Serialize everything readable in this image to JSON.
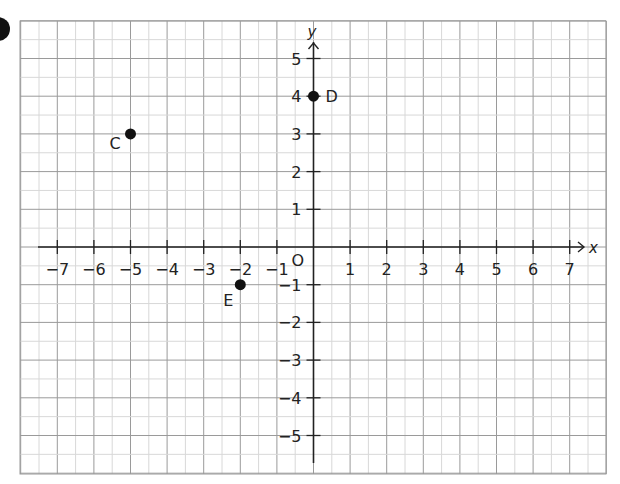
{
  "chart_data": {
    "type": "scatter",
    "title": "",
    "xlabel": "x",
    "ylabel": "y",
    "origin_label": "O",
    "xlim": [
      -7,
      7
    ],
    "ylim": [
      -5,
      5
    ],
    "x_ticks": [
      -7,
      -6,
      -5,
      -4,
      -3,
      -2,
      -1,
      1,
      2,
      3,
      4,
      5,
      6,
      7
    ],
    "y_ticks": [
      5,
      4,
      3,
      2,
      1,
      -1,
      -2,
      -3,
      -4,
      -5
    ],
    "x_tick_labels": [
      "−7",
      "−6",
      "−5",
      "−4",
      "−3",
      "−2",
      "−1",
      "1",
      "2",
      "3",
      "4",
      "5",
      "6",
      "7"
    ],
    "y_tick_labels": [
      "5",
      "4",
      "3",
      "2",
      "1",
      "−1",
      "−2",
      "−3",
      "−4",
      "−5"
    ],
    "grid": true,
    "grid_minor": true,
    "points": [
      {
        "label": "C",
        "x": -5,
        "y": 3
      },
      {
        "label": "D",
        "x": 0,
        "y": 4
      },
      {
        "label": "E",
        "x": -2,
        "y": -1
      }
    ]
  },
  "colors": {
    "grid_major": "#9a9a9a",
    "grid_minor": "#d8d8d8",
    "axis": "#222222",
    "point": "#111111"
  }
}
